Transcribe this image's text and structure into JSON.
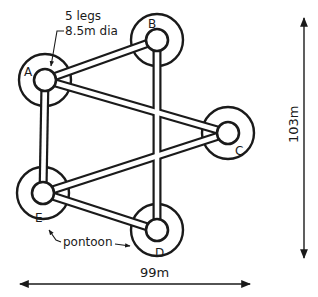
{
  "diagram": {
    "annotation_legs": "5 legs",
    "annotation_dia": "8.5m dia",
    "pontoon_label": "pontoon",
    "width_dimension": "99m",
    "height_dimension": "103m",
    "legs": [
      {
        "id": "A",
        "label": "A"
      },
      {
        "id": "B",
        "label": "B"
      },
      {
        "id": "C",
        "label": "C"
      },
      {
        "id": "D",
        "label": "D"
      },
      {
        "id": "E",
        "label": "E"
      }
    ],
    "stroke_color": "#1a1a1a",
    "background_color": "#ffffff"
  }
}
